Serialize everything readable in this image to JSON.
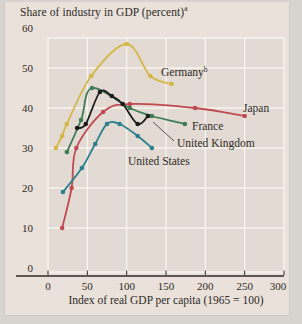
{
  "figure": {
    "title": "Share of industry in GDP (percent)",
    "title_sup": "a",
    "x_axis_title": "Index of real GDP per capita (1965 = 100)"
  },
  "chart_data": {
    "type": "line",
    "title": "Share of industry in GDP (percent)",
    "xlabel": "Index of real GDP per capita (1965 = 100)",
    "ylabel": "Share of industry in GDP (percent)",
    "xlim": [
      0,
      300
    ],
    "ylim": [
      0,
      60
    ],
    "x_ticks": [
      0,
      50,
      100,
      150,
      200,
      250,
      300
    ],
    "y_ticks": [
      0,
      10,
      20,
      30,
      40,
      50,
      60
    ],
    "grid": "on",
    "legend_position": "inline-labels",
    "colors": {
      "plot_background": "#e3dad4",
      "gridline": "#f7f3ee",
      "axis": "#2e2a26",
      "germany": "#d4b847",
      "japan": "#c04a52",
      "france": "#3c7d55",
      "united_kingdom": "#1c1c1c",
      "united_states": "#2a808e"
    },
    "series": [
      {
        "name": "Germany",
        "sup": "b",
        "color": "#d4b847",
        "points": [
          [
            10,
            30
          ],
          [
            18,
            33
          ],
          [
            24,
            36
          ],
          [
            55,
            48
          ],
          [
            100,
            56
          ],
          [
            130,
            48
          ],
          [
            157,
            46
          ]
        ],
        "label_px": [
          161,
          76
        ]
      },
      {
        "name": "Japan",
        "color": "#c04a52",
        "points": [
          [
            18,
            10
          ],
          [
            30,
            20
          ],
          [
            36,
            30
          ],
          [
            70,
            39
          ],
          [
            104,
            41
          ],
          [
            187,
            40
          ],
          [
            250,
            38
          ]
        ],
        "label_px": [
          243,
          112
        ]
      },
      {
        "name": "France",
        "color": "#3c7d55",
        "points": [
          [
            24,
            29
          ],
          [
            42,
            37
          ],
          [
            56,
            45
          ],
          [
            104,
            40
          ],
          [
            132,
            38
          ],
          [
            174,
            36
          ]
        ],
        "label_px": [
          192,
          130
        ]
      },
      {
        "name": "United Kingdom",
        "color": "#1c1c1c",
        "points": [
          [
            37,
            35
          ],
          [
            48,
            36
          ],
          [
            66,
            44
          ],
          [
            81,
            43
          ],
          [
            95,
            41
          ],
          [
            114,
            36
          ],
          [
            127,
            38
          ]
        ],
        "label_px": [
          177,
          147
        ],
        "callout": [
          [
            174,
            141
          ],
          [
            153,
            122
          ]
        ]
      },
      {
        "name": "United States",
        "color": "#2a808e",
        "points": [
          [
            19,
            19
          ],
          [
            43,
            25
          ],
          [
            60,
            31
          ],
          [
            75,
            36
          ],
          [
            91,
            36
          ],
          [
            114,
            33
          ],
          [
            132,
            30
          ]
        ],
        "label_px": [
          128,
          165
        ]
      }
    ]
  }
}
